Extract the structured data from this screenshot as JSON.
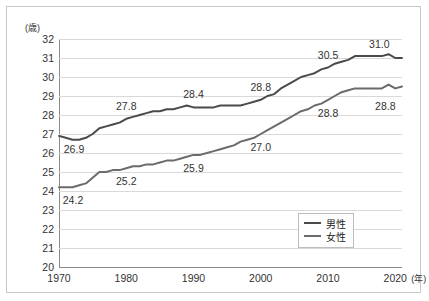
{
  "axis": {
    "y_unit": "(歳)",
    "x_unit": "(年)",
    "y_ticks": [
      "32",
      "31",
      "30",
      "29",
      "28",
      "27",
      "26",
      "25",
      "24",
      "23",
      "22",
      "21",
      "20"
    ],
    "x_ticks": [
      "1970",
      "1980",
      "1990",
      "2000",
      "2010",
      "2020"
    ]
  },
  "legend": {
    "items": [
      {
        "label": "男性",
        "color": "#4a4a4a"
      },
      {
        "label": "女性",
        "color": "#6b6b6b"
      }
    ]
  },
  "annotations": {
    "male": [
      {
        "text": "26.9",
        "year": 1970,
        "value": 26.9
      },
      {
        "text": "27.8",
        "year": 1980,
        "value": 27.8
      },
      {
        "text": "28.4",
        "year": 1990,
        "value": 28.4
      },
      {
        "text": "28.8",
        "year": 2000,
        "value": 28.8
      },
      {
        "text": "30.5",
        "year": 2010,
        "value": 30.5
      },
      {
        "text": "31.0",
        "year": 2020,
        "value": 31.0
      }
    ],
    "female": [
      {
        "text": "24.2",
        "year": 1970,
        "value": 24.2
      },
      {
        "text": "25.2",
        "year": 1980,
        "value": 25.2
      },
      {
        "text": "25.9",
        "year": 1990,
        "value": 25.9
      },
      {
        "text": "27.0",
        "year": 2000,
        "value": 27.0
      },
      {
        "text": "28.8",
        "year": 2010,
        "value": 28.8
      },
      {
        "text": "28.8",
        "year": 2020,
        "value": 28.8
      }
    ]
  },
  "chart_data": {
    "type": "line",
    "title": "",
    "xlabel": "(年)",
    "ylabel": "(歳)",
    "xlim": [
      1970,
      2021
    ],
    "ylim": [
      20,
      32
    ],
    "grid": true,
    "legend_position": "inside-bottom-right",
    "x": [
      1970,
      1971,
      1972,
      1973,
      1974,
      1975,
      1976,
      1977,
      1978,
      1979,
      1980,
      1981,
      1982,
      1983,
      1984,
      1985,
      1986,
      1987,
      1988,
      1989,
      1990,
      1991,
      1992,
      1993,
      1994,
      1995,
      1996,
      1997,
      1998,
      1999,
      2000,
      2001,
      2002,
      2003,
      2004,
      2005,
      2006,
      2007,
      2008,
      2009,
      2010,
      2011,
      2012,
      2013,
      2014,
      2015,
      2016,
      2017,
      2018,
      2019,
      2020,
      2021
    ],
    "series": [
      {
        "name": "男性",
        "color": "#4a4a4a",
        "values": [
          26.9,
          26.8,
          26.7,
          26.7,
          26.8,
          27.0,
          27.3,
          27.4,
          27.5,
          27.6,
          27.8,
          27.9,
          28.0,
          28.1,
          28.2,
          28.2,
          28.3,
          28.3,
          28.4,
          28.5,
          28.4,
          28.4,
          28.4,
          28.4,
          28.5,
          28.5,
          28.5,
          28.5,
          28.6,
          28.7,
          28.8,
          29.0,
          29.1,
          29.4,
          29.6,
          29.8,
          30.0,
          30.1,
          30.2,
          30.4,
          30.5,
          30.7,
          30.8,
          30.9,
          31.1,
          31.1,
          31.1,
          31.1,
          31.1,
          31.2,
          31.0,
          31.0
        ]
      },
      {
        "name": "女性",
        "color": "#6b6b6b",
        "values": [
          24.2,
          24.2,
          24.2,
          24.3,
          24.4,
          24.7,
          25.0,
          25.0,
          25.1,
          25.1,
          25.2,
          25.3,
          25.3,
          25.4,
          25.4,
          25.5,
          25.6,
          25.6,
          25.7,
          25.8,
          25.9,
          25.9,
          26.0,
          26.1,
          26.2,
          26.3,
          26.4,
          26.6,
          26.7,
          26.8,
          27.0,
          27.2,
          27.4,
          27.6,
          27.8,
          28.0,
          28.2,
          28.3,
          28.5,
          28.6,
          28.8,
          29.0,
          29.2,
          29.3,
          29.4,
          29.4,
          29.4,
          29.4,
          29.4,
          29.6,
          29.4,
          29.5
        ]
      }
    ]
  }
}
